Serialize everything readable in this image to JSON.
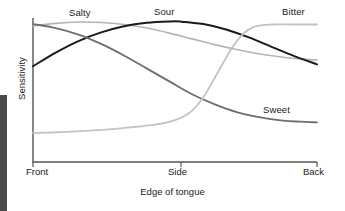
{
  "chart_data": {
    "type": "line",
    "title": "",
    "xlabel": "Edge of tongue",
    "ylabel": "Sensitivity",
    "x_tick_labels": [
      "Front",
      "Side",
      "Back"
    ],
    "x_tick_positions": [
      0,
      0.52,
      1.0
    ],
    "xlim": [
      0,
      1
    ],
    "ylim": [
      0,
      1
    ],
    "y_tick_labels": [],
    "grid": false,
    "legend_position": "inline-curve-labels",
    "axis_style": "L-shaped spine, left and bottom only",
    "series": [
      {
        "name": "Salty",
        "label": "Salty",
        "color": "#b4b4b4",
        "line_width": 1.6,
        "x": [
          0.0,
          0.08,
          0.16,
          0.24,
          0.32,
          0.4,
          0.48,
          0.56,
          0.64,
          0.72,
          0.8,
          0.88,
          0.94,
          1.0
        ],
        "values": [
          0.945,
          0.963,
          0.972,
          0.969,
          0.955,
          0.93,
          0.895,
          0.855,
          0.815,
          0.78,
          0.75,
          0.728,
          0.716,
          0.708
        ]
      },
      {
        "name": "Sour",
        "label": "Sour",
        "color": "#1a1a1a",
        "line_width": 2.0,
        "x": [
          0.0,
          0.08,
          0.16,
          0.24,
          0.32,
          0.4,
          0.48,
          0.52,
          0.6,
          0.68,
          0.76,
          0.84,
          0.92,
          1.0
        ],
        "values": [
          0.665,
          0.76,
          0.84,
          0.9,
          0.943,
          0.967,
          0.976,
          0.975,
          0.958,
          0.92,
          0.865,
          0.8,
          0.735,
          0.678
        ]
      },
      {
        "name": "Sweet",
        "label": "Sweet",
        "color": "#6e6e6e",
        "line_width": 1.8,
        "x": [
          0.0,
          0.08,
          0.16,
          0.24,
          0.32,
          0.4,
          0.48,
          0.56,
          0.64,
          0.72,
          0.8,
          0.88,
          0.94,
          1.0
        ],
        "values": [
          0.958,
          0.93,
          0.885,
          0.82,
          0.74,
          0.65,
          0.56,
          0.47,
          0.4,
          0.345,
          0.31,
          0.288,
          0.28,
          0.275
        ]
      },
      {
        "name": "Bitter",
        "label": "Bitter",
        "color": "#c3c3c3",
        "line_width": 1.8,
        "x": [
          0.0,
          0.1,
          0.2,
          0.3,
          0.4,
          0.48,
          0.55,
          0.6,
          0.65,
          0.7,
          0.74,
          0.78,
          0.84,
          0.92,
          1.0
        ],
        "values": [
          0.2,
          0.208,
          0.218,
          0.232,
          0.252,
          0.278,
          0.34,
          0.45,
          0.62,
          0.79,
          0.89,
          0.94,
          0.955,
          0.955,
          0.955
        ]
      }
    ]
  },
  "axis": {
    "x_label": "Edge of tongue",
    "y_label": "Sensitivity",
    "tick_front": "Front",
    "tick_side": "Side",
    "tick_back": "Back",
    "spine_color": "#555555"
  },
  "labels": {
    "salty": "Salty",
    "sour": "Sour",
    "bitter": "Bitter",
    "sweet": "Sweet"
  }
}
